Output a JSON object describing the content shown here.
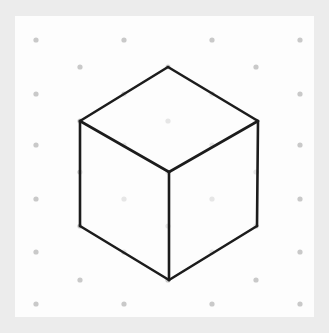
{
  "canvas": {
    "width": 329,
    "height": 333,
    "frame_color": "#ececec",
    "panel_color": "#fdfdfd",
    "panel_rect": [
      15,
      16,
      299,
      301
    ]
  },
  "grid": {
    "label": "isometric-dot-grid",
    "dot_color": "#c9c9c9",
    "dot_radius": 2.6,
    "row_spacing": 27,
    "col_spacing": 88,
    "points": [
      [
        36,
        40
      ],
      [
        124,
        40
      ],
      [
        212,
        40
      ],
      [
        300,
        40
      ],
      [
        80,
        67
      ],
      [
        168,
        67
      ],
      [
        256,
        67
      ],
      [
        36,
        94
      ],
      [
        124,
        94
      ],
      [
        212,
        94
      ],
      [
        300,
        94
      ],
      [
        80,
        121
      ],
      [
        168,
        121
      ],
      [
        256,
        121
      ],
      [
        36,
        145
      ],
      [
        124,
        145
      ],
      [
        212,
        145
      ],
      [
        300,
        145
      ],
      [
        80,
        172
      ],
      [
        168,
        172
      ],
      [
        256,
        172
      ],
      [
        36,
        199
      ],
      [
        124,
        199
      ],
      [
        212,
        199
      ],
      [
        300,
        199
      ],
      [
        80,
        226
      ],
      [
        168,
        226
      ],
      [
        256,
        226
      ],
      [
        36,
        252
      ],
      [
        124,
        252
      ],
      [
        212,
        252
      ],
      [
        300,
        252
      ],
      [
        80,
        280
      ],
      [
        168,
        280
      ],
      [
        256,
        280
      ],
      [
        36,
        304
      ],
      [
        124,
        304
      ],
      [
        212,
        304
      ],
      [
        300,
        304
      ]
    ]
  },
  "shape": {
    "name": "isometric-cube",
    "stroke_color": "#1c1c1c",
    "stroke_width": 2.6,
    "fill_color": "none",
    "vertices": {
      "top": [
        168,
        67
      ],
      "upper_left": [
        80,
        121
      ],
      "upper_right": [
        258,
        121
      ],
      "center": [
        169,
        172
      ],
      "lower_left": [
        80,
        226
      ],
      "lower_right": [
        257,
        226
      ],
      "bottom": [
        169,
        280
      ]
    },
    "faces": [
      {
        "name": "top-face",
        "points": "168,67 80,121 169,172 258,121"
      },
      {
        "name": "left-face",
        "points": "80,121 80,226 169,280 169,172"
      },
      {
        "name": "right-face",
        "points": "258,121 257,226 169,280 169,172"
      }
    ],
    "edges": [
      {
        "name": "edge-top-to-upper-left",
        "from": [
          168,
          67
        ],
        "to": [
          80,
          121
        ]
      },
      {
        "name": "edge-top-to-upper-right",
        "from": [
          168,
          67
        ],
        "to": [
          258,
          121
        ]
      },
      {
        "name": "edge-upper-left-to-center",
        "from": [
          80,
          121
        ],
        "to": [
          169,
          172
        ]
      },
      {
        "name": "edge-upper-right-to-center",
        "from": [
          258,
          121
        ],
        "to": [
          169,
          172
        ]
      },
      {
        "name": "edge-upper-left-to-lower-left",
        "from": [
          80,
          121
        ],
        "to": [
          80,
          226
        ]
      },
      {
        "name": "edge-upper-right-to-lower-right",
        "from": [
          258,
          121
        ],
        "to": [
          257,
          226
        ]
      },
      {
        "name": "edge-center-to-bottom",
        "from": [
          169,
          172
        ],
        "to": [
          169,
          280
        ]
      },
      {
        "name": "edge-lower-left-to-bottom",
        "from": [
          80,
          226
        ],
        "to": [
          169,
          280
        ]
      },
      {
        "name": "edge-lower-right-to-bottom",
        "from": [
          257,
          226
        ],
        "to": [
          169,
          280
        ]
      }
    ]
  }
}
